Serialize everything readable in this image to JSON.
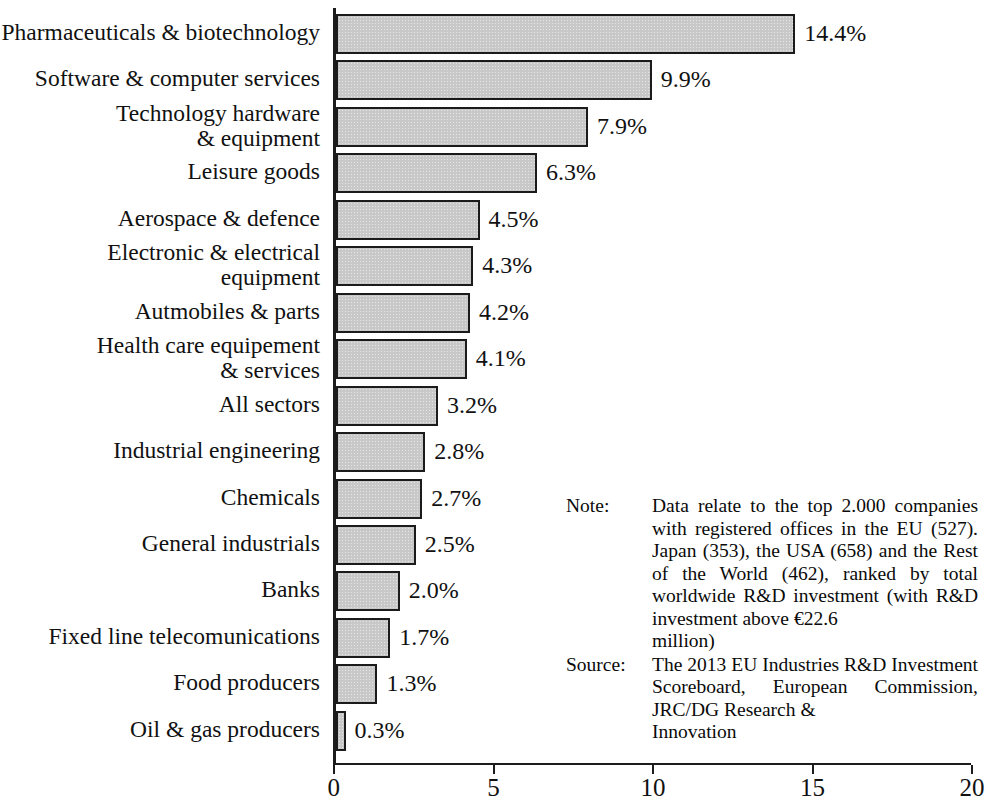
{
  "chart_data": {
    "type": "bar",
    "orientation": "horizontal",
    "title": "",
    "xlabel": "",
    "ylabel": "",
    "xlim": [
      0,
      20
    ],
    "xticks": [
      0,
      5,
      10,
      15,
      20
    ],
    "xtick_labels": [
      "0",
      "5",
      "10",
      "15",
      "20"
    ],
    "grid": false,
    "legend": false,
    "value_suffix": "%",
    "bar_fill_color": "#c8c8c8",
    "bar_edge_color": "#1b1b1b",
    "axis_color": "#1c1c1c",
    "categories": [
      "Pharmaceuticals & biotechnology",
      "Software & computer services",
      "Technology hardware\n& equipment",
      "Leisure goods",
      "Aerospace & defence",
      "Electronic & electrical\nequipment",
      "Autmobiles & parts",
      "Health care equipement\n& services",
      "All sectors",
      "Industrial engineering",
      "Chemicals",
      "General industrials",
      "Banks",
      "Fixed line telecomunications",
      "Food producers",
      "Oil & gas producers"
    ],
    "values": [
      14.4,
      9.9,
      7.9,
      6.3,
      4.5,
      4.3,
      4.2,
      4.1,
      3.2,
      2.8,
      2.7,
      2.5,
      2.0,
      1.7,
      1.3,
      0.3
    ],
    "value_labels": [
      "14.4%",
      "9.9%",
      "7.9%",
      "6.3%",
      "4.5%",
      "4.3%",
      "4.2%",
      "4.1%",
      "3.2%",
      "2.8%",
      "2.7%",
      "2.5%",
      "2.0%",
      "1.7%",
      "1.3%",
      "0.3%"
    ]
  },
  "notes": [
    {
      "key": "Note:",
      "body": "Data relate to the top 2.000 companies with registered offices in the EU (527). Japan (353), the USA (658) and the Rest of the World (462), ranked by total worldwide R&D investment (with R&D investment above €22.6",
      "last_line": "million)"
    },
    {
      "key": "Source:",
      "body": "The 2013 EU Industries R&D Investment Scoreboard, European Commission, JRC/DG Research &",
      "last_line": "Innovation"
    }
  ]
}
